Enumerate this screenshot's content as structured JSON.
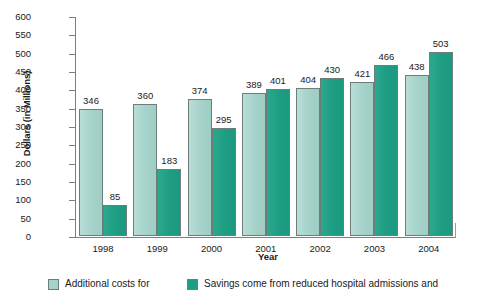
{
  "chart_data": {
    "type": "bar",
    "title": "",
    "categories": [
      "1998",
      "1999",
      "2000",
      "2001",
      "2002",
      "2003",
      "2004"
    ],
    "series": [
      {
        "name": "Additional costs for",
        "color": "#a5d2c9",
        "values": [
          346,
          360,
          374,
          389,
          404,
          421,
          438
        ]
      },
      {
        "name": "Savings come from reduced hospital admissions and",
        "color": "#1e9d83",
        "values": [
          85,
          183,
          295,
          401,
          430,
          466,
          503
        ]
      }
    ],
    "xlabel": "Year",
    "ylabel": "Dollars (in Millions)",
    "ylim": [
      0,
      600
    ],
    "ytick_values": [
      0,
      50,
      100,
      150,
      200,
      250,
      300,
      350,
      400,
      450,
      500,
      550,
      600
    ],
    "ytick_labels": [
      "0",
      "50",
      "100",
      "150",
      "200",
      "250",
      "300",
      "350",
      "400",
      "450",
      "500",
      "550",
      "600"
    ],
    "grid": false,
    "legend_position": "bottom",
    "bar_value_labels": true
  },
  "axes": {
    "y_title": "Dollars (in Millions)",
    "x_title": "Year"
  },
  "legend": {
    "items": [
      {
        "label": "Additional costs for",
        "color": "#a5d2c9"
      },
      {
        "label": "Savings come from reduced hospital admissions and",
        "color": "#1e9d83"
      }
    ]
  },
  "colors": {
    "series_light": "#a5d2c9",
    "series_dark": "#1e9d83",
    "axis": "#7d7d7d",
    "text": "#1a1a1a",
    "background": "#ffffff"
  }
}
